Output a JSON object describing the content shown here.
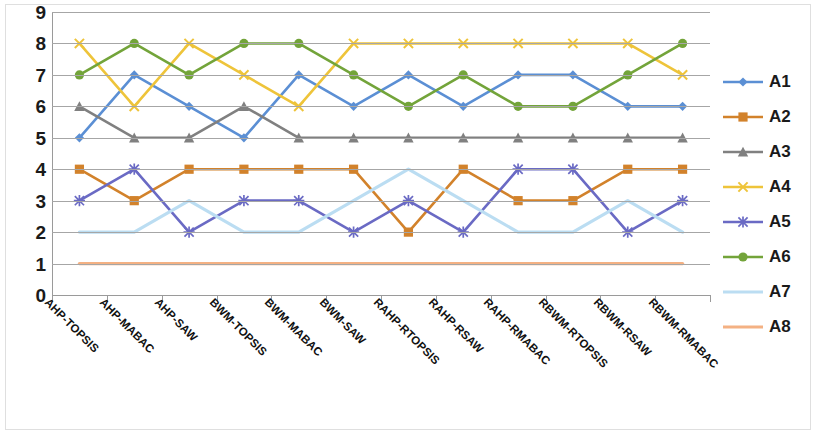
{
  "chart_data": {
    "type": "line",
    "title": "",
    "xlabel": "",
    "ylabel": "",
    "ylim": [
      0,
      9
    ],
    "ytick_step": 1,
    "yticks": [
      "9",
      "8",
      "7",
      "6",
      "5",
      "4",
      "3",
      "2",
      "1",
      "0"
    ],
    "grid": true,
    "legend_position": "right",
    "categories": [
      "AHP-TOPSIS",
      "AHP-MABAC",
      "AHP-SAW",
      "BWM-TOPSIS",
      "BWM-MABAC",
      "BWM-SAW",
      "RAHP-RTOPSIS",
      "RAHP-RSAW",
      "RAHP-RMABAC",
      "RBWM-RTOPSIS",
      "RBWM-RSAW",
      "RBWM-RMABAC"
    ],
    "series": [
      {
        "name": "A1",
        "color": "#5B8FD4",
        "marker": "diamond",
        "values": [
          5,
          7,
          6,
          5,
          7,
          6,
          7,
          6,
          7,
          7,
          6,
          6
        ]
      },
      {
        "name": "A2",
        "color": "#D2822B",
        "marker": "square",
        "values": [
          4,
          3,
          4,
          4,
          4,
          4,
          2,
          4,
          3,
          3,
          4,
          4
        ]
      },
      {
        "name": "A3",
        "color": "#808080",
        "marker": "triangle",
        "values": [
          6,
          5,
          5,
          6,
          5,
          5,
          5,
          5,
          5,
          5,
          5,
          5
        ]
      },
      {
        "name": "A4",
        "color": "#EEC43A",
        "marker": "cross",
        "values": [
          8,
          6,
          8,
          7,
          6,
          8,
          8,
          8,
          8,
          8,
          8,
          7
        ]
      },
      {
        "name": "A5",
        "color": "#6A6AC4",
        "marker": "asterisk",
        "values": [
          3,
          4,
          2,
          3,
          3,
          2,
          3,
          2,
          4,
          4,
          2,
          3
        ]
      },
      {
        "name": "A6",
        "color": "#73A43A",
        "marker": "circle",
        "values": [
          7,
          8,
          7,
          8,
          8,
          7,
          6,
          7,
          6,
          6,
          7,
          8
        ]
      },
      {
        "name": "A7",
        "color": "#BBDDF2",
        "marker": "none",
        "values": [
          2,
          2,
          3,
          2,
          2,
          3,
          4,
          3,
          2,
          2,
          3,
          2
        ]
      },
      {
        "name": "A8",
        "color": "#F4B183",
        "marker": "none",
        "values": [
          1,
          1,
          1,
          1,
          1,
          1,
          1,
          1,
          1,
          1,
          1,
          1
        ]
      }
    ]
  },
  "legend": {
    "entries": [
      "A1",
      "A2",
      "A3",
      "A4",
      "A5",
      "A6",
      "A7",
      "A8"
    ]
  }
}
